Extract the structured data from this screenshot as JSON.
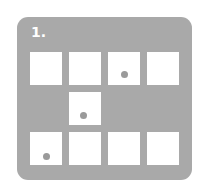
{
  "figure": {
    "label": "1.",
    "panel_color": "#a9a9a9",
    "cell_color": "#ffffff",
    "dot_color": "#9a9a9a",
    "grid": {
      "rows": 3,
      "cols": 4,
      "cells": [
        {
          "row": 0,
          "col": 0,
          "present": true,
          "dot": null
        },
        {
          "row": 0,
          "col": 1,
          "present": true,
          "dot": null
        },
        {
          "row": 0,
          "col": 2,
          "present": true,
          "dot": "center-bottom"
        },
        {
          "row": 0,
          "col": 3,
          "present": true,
          "dot": null
        },
        {
          "row": 1,
          "col": 0,
          "present": false,
          "dot": null
        },
        {
          "row": 1,
          "col": 1,
          "present": true,
          "dot": "left-bottom"
        },
        {
          "row": 1,
          "col": 2,
          "present": false,
          "dot": null
        },
        {
          "row": 1,
          "col": 3,
          "present": false,
          "dot": null
        },
        {
          "row": 2,
          "col": 0,
          "present": true,
          "dot": "left-bottom"
        },
        {
          "row": 2,
          "col": 1,
          "present": true,
          "dot": null
        },
        {
          "row": 2,
          "col": 2,
          "present": true,
          "dot": null
        },
        {
          "row": 2,
          "col": 3,
          "present": true,
          "dot": null
        }
      ]
    }
  }
}
